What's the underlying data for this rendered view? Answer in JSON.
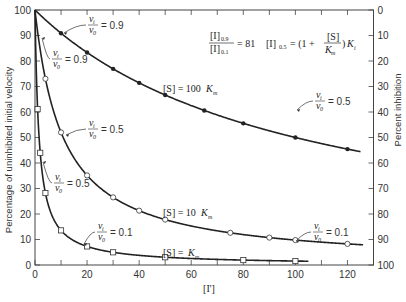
{
  "chart_data": {
    "type": "line",
    "title": "",
    "xlabel": "[I']",
    "ylabel": "Percentage of uninhibited initial velocity",
    "ylabel_right": "Percent inhibition",
    "xlim": [
      0,
      130
    ],
    "ylim": [
      0,
      100
    ],
    "ylim_right": [
      100,
      0
    ],
    "x_ticks": [
      0,
      20,
      40,
      60,
      80,
      100,
      120
    ],
    "y_ticks": [
      0,
      10,
      20,
      30,
      40,
      50,
      60,
      70,
      80,
      90,
      100
    ],
    "y_ticks_right": [
      0,
      10,
      20,
      30,
      40,
      50,
      60,
      70,
      80,
      90,
      100
    ],
    "grid": false,
    "series": [
      {
        "name": "[S] = 100 Km",
        "marker": "filled-circle",
        "x": [
          0,
          10,
          20,
          30,
          40,
          50,
          65,
          80,
          100,
          120
        ],
        "y": [
          100,
          91,
          83,
          77,
          72,
          67,
          61,
          55,
          50,
          45
        ]
      },
      {
        "name": "[S] = 10 Km",
        "marker": "open-circle",
        "x": [
          0,
          4,
          10,
          20,
          30,
          40,
          50,
          75,
          90,
          100,
          120
        ],
        "y": [
          100,
          68,
          52,
          35,
          26,
          21,
          18,
          12,
          10,
          9,
          8
        ]
      },
      {
        "name": "[S] = Km",
        "marker": "open-square",
        "x": [
          0,
          1,
          2,
          4,
          10,
          20,
          30,
          50,
          80,
          100
        ],
        "y": [
          100,
          68,
          44,
          29,
          16,
          8,
          5,
          2,
          1,
          1
        ]
      }
    ],
    "annotations": [
      "vi/v0 = 0.9",
      "vi/v0 = 0.9",
      "vi/v0 = 0.5",
      "vi/v0 = 0.5",
      "vi/v0 = 0.5",
      "vi/v0 = 0.1",
      "vi/v0 = 0.1",
      "[I]0.9/[I]0.1 = 81",
      "[I]0.5 = (1 + [S]/Km) Ki"
    ]
  },
  "labels": {
    "xlabel": "[I']",
    "ylabel": "Percentage of uninhibited initial velocity",
    "ylabel_right": "Percent inhibition",
    "curve_100": "[S] = 100",
    "curve_10": "[S] = 10",
    "curve_1": "[S] =",
    "km": "K",
    "km_sub": "m",
    "ratio_value": "= 81",
    "eq_lhs": "[I]",
    "eq_lhs_sub": "0.5",
    "eq_rhs": "= (1 +",
    "eq_close": ")",
    "ki": "K",
    "ki_sub": "i",
    "eq_S": "[S]",
    "eq_Km": "K",
    "frac_num_i": "[I]",
    "frac_num_sub": "0.9",
    "frac_den_i": "[I]",
    "frac_den_sub": "0.1",
    "vi": "v",
    "vi_sub": "i",
    "v0": "v",
    "v0_sub": "0",
    "eq_09": "= 0.9",
    "eq_05": "= 0.5",
    "eq_01": "= 0.1"
  }
}
